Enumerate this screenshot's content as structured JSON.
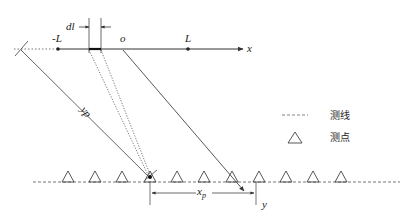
{
  "diagram": {
    "colors": {
      "line": "#333333",
      "light_line": "#555555",
      "dotted": "#666666",
      "background": "#ffffff"
    },
    "axes": {
      "x_label": "x",
      "y_label": "y",
      "origin_label": "o"
    },
    "points": {
      "neg_L": "-L",
      "pos_L": "L"
    },
    "annotations": {
      "element_length": "dl",
      "slant_distance": "yp",
      "horizontal_offset": "xp",
      "horizontal_offset_sub": "p"
    },
    "station_count": 11,
    "legend": {
      "items": [
        {
          "symbol": "dashed-line",
          "label": "测线"
        },
        {
          "symbol": "triangle",
          "label": "测点"
        }
      ]
    }
  }
}
